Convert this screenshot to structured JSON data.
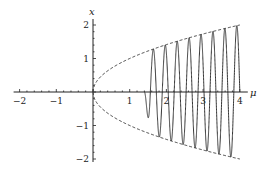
{
  "chart_data": {
    "type": "line",
    "title": "",
    "xlabel": "μ",
    "ylabel": "x",
    "xlim": [
      -2,
      4
    ],
    "ylim": [
      -2,
      2
    ],
    "x_ticks": [
      "-2",
      "-1",
      "1",
      "2",
      "3",
      "4"
    ],
    "y_ticks": [
      "2",
      "1",
      "-1",
      "-2"
    ],
    "x_tick_values": [
      -2,
      -1,
      1,
      2,
      3,
      4
    ],
    "y_tick_values": [
      2,
      1,
      -1,
      -2
    ],
    "grid": false,
    "legend": null,
    "series": [
      {
        "name": "upper envelope x = +sqrt(μ)",
        "style": "dashed",
        "domain": [
          0,
          4
        ]
      },
      {
        "name": "lower envelope x = -sqrt(μ)",
        "style": "dashed",
        "domain": [
          0,
          4
        ]
      },
      {
        "name": "oscillating trajectory",
        "style": "solid",
        "domain": [
          1.4,
          4
        ],
        "oscillations": 8,
        "amplitude": "grows to sqrt(μ)"
      }
    ],
    "colors": {
      "axis": "#222222",
      "curve": "#333333",
      "envelope": "#444444"
    }
  }
}
